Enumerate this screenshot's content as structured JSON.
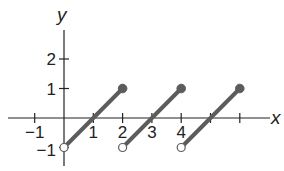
{
  "chart_data": {
    "type": "line",
    "title": "",
    "xlabel": "x",
    "ylabel": "y",
    "xlim": [
      -2,
      7
    ],
    "ylim": [
      -1.5,
      3
    ],
    "grid": false,
    "x_tick_labels": [
      {
        "value": -1,
        "label": "−1"
      },
      {
        "value": 1,
        "label": "1"
      },
      {
        "value": 2,
        "label": "2"
      },
      {
        "value": 3,
        "label": "3"
      },
      {
        "value": 4,
        "label": "4"
      }
    ],
    "x_tick_marks": [
      -1,
      1,
      2,
      3,
      4,
      5,
      6
    ],
    "y_tick_labels": [
      {
        "value": 2,
        "label": "2"
      },
      {
        "value": 1,
        "label": "1"
      },
      {
        "value": -1,
        "label": "−1"
      }
    ],
    "series": [
      {
        "name": "segment-1",
        "x": [
          0,
          2
        ],
        "y": [
          -1,
          1
        ],
        "start": "open",
        "end": "closed"
      },
      {
        "name": "segment-2",
        "x": [
          2,
          4
        ],
        "y": [
          -1,
          1
        ],
        "start": "open",
        "end": "closed"
      },
      {
        "name": "segment-3",
        "x": [
          4,
          6
        ],
        "y": [
          -1,
          1
        ],
        "start": "open",
        "end": "closed"
      }
    ],
    "colors": {
      "segment": "#5c5c5c",
      "axis": "#222222"
    }
  }
}
